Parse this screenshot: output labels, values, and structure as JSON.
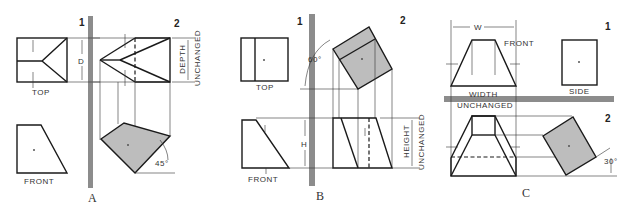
{
  "figure": {
    "panels": [
      {
        "caption": "A",
        "plane_labels": [
          "1",
          "2"
        ],
        "view_labels": {
          "top": "TOP",
          "front": "FRONT"
        },
        "dimension_label": "D",
        "note_line1": "DEPTH",
        "note_line2": "UNCHANGED",
        "angle": "45°"
      },
      {
        "caption": "B",
        "plane_labels": [
          "1",
          "2"
        ],
        "view_labels": {
          "top": "TOP",
          "front": "FRONT"
        },
        "dimension_label": "H",
        "note_line1": "HEIGHT",
        "note_line2": "UNCHANGED",
        "angle": "60°"
      },
      {
        "caption": "C",
        "plane_labels": [
          "1",
          "2"
        ],
        "view_labels": {
          "front": "FRONT",
          "side": "SIDE"
        },
        "dimension_label": "W",
        "note_line1": "WIDTH",
        "note_line2": "UNCHANGED",
        "angle": "30°"
      }
    ],
    "colors": {
      "line": "#1a1a1a",
      "shade": "#bdbdbd",
      "plane": "#8c8c8c",
      "background": "#ffffff"
    }
  }
}
